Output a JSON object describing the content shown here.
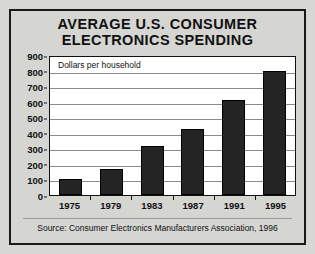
{
  "figure": {
    "title_line_1": "AVERAGE U.S. CONSUMER",
    "title_line_2": "ELECTRONICS SPENDING",
    "inline_note": "Dollars per household",
    "source": "Source:  Consumer Electronics Manufacturers Association, 1996",
    "colors": {
      "page_background": "#d7d7d4",
      "panel_background": "#d5d5d2",
      "panel_border": "#1a1a1a",
      "plot_background": "#ffffff",
      "bar_fill": "#242424",
      "gridline": "#8a8a8a",
      "text": "#111111"
    }
  },
  "chart_data": {
    "type": "bar",
    "title": "AVERAGE U.S. CONSUMER ELECTRONICS SPENDING",
    "subtitle": "Dollars per household",
    "xlabel": "",
    "ylabel": "Dollars per household",
    "categories": [
      "1975",
      "1979",
      "1983",
      "1987",
      "1991",
      "1995"
    ],
    "values": [
      100,
      170,
      315,
      425,
      610,
      800
    ],
    "ylim": [
      0,
      900
    ],
    "yticks": [
      0,
      100,
      200,
      300,
      400,
      500,
      600,
      700,
      800,
      900
    ],
    "ytick_labels": [
      "0",
      "100",
      "200",
      "300",
      "400",
      "500",
      "600",
      "700",
      "800",
      "900"
    ],
    "grid": true,
    "legend": false,
    "annotations": [
      "Source:  Consumer Electronics Manufacturers Association, 1996"
    ]
  }
}
